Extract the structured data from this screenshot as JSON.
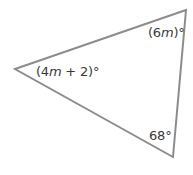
{
  "figure": {
    "type": "triangle",
    "stroke_color": "#8c8c8c",
    "vertices": {
      "left": [
        15,
        69
      ],
      "top_right": [
        186,
        10
      ],
      "bottom": [
        173,
        157
      ]
    },
    "angles": [
      {
        "vertex": "left",
        "pre": "(4",
        "var": "m",
        "post": " + 2)°"
      },
      {
        "vertex": "top_right",
        "pre": "(6",
        "var": "m",
        "post": ")°"
      },
      {
        "vertex": "bottom",
        "pre": "68°",
        "var": "",
        "post": ""
      }
    ]
  }
}
